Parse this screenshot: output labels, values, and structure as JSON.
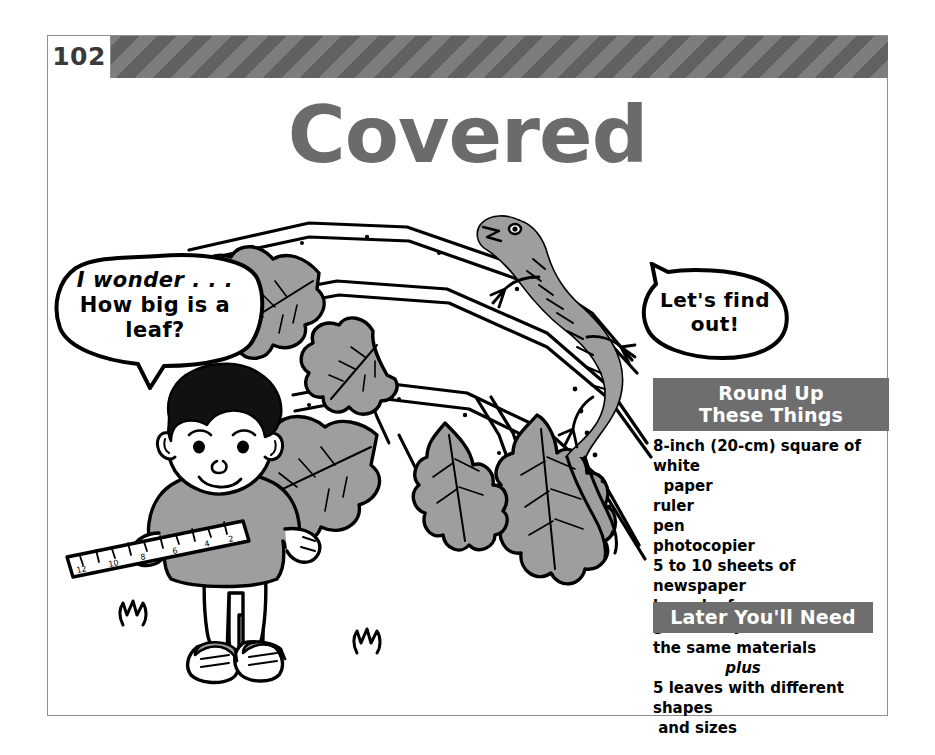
{
  "page": {
    "number": "102",
    "title": "Covered"
  },
  "bubbles": {
    "left": {
      "line1": "I wonder . . .",
      "line2": "How big is a",
      "line3": "leaf?"
    },
    "right": {
      "line1": "Let's find",
      "line2": "out!"
    }
  },
  "panels": {
    "roundup": {
      "heading_line1": "Round Up",
      "heading_line2": "These Things",
      "items": [
        "8-inch (20-cm) square of white\n  paper",
        "ruler",
        "pen",
        "photocopier",
        "5 to 10 sheets of newspaper",
        "large leaf",
        "green crayon"
      ]
    },
    "later": {
      "heading": "Later You'll Need",
      "line1": "the same materials",
      "plus": "plus",
      "line2": "5 leaves with different shapes\n and sizes"
    }
  },
  "illustration": {
    "alt": "Boy measuring a leaf with a ruler beneath an oak branch with a lizard",
    "elements": [
      "boy-figure",
      "oak-branch",
      "oak-leaves",
      "lizard",
      "ruler",
      "grass-tufts"
    ]
  },
  "colors": {
    "title_gray": "#6b6b6b",
    "panel_heading_gray": "#6e6e6e",
    "band_stripe_light": "#7d7d7d",
    "band_stripe_dark": "#616161",
    "art_fill_gray": "#9e9e9e",
    "ink_black": "#000000",
    "frame_gray": "#8f8f8f"
  }
}
